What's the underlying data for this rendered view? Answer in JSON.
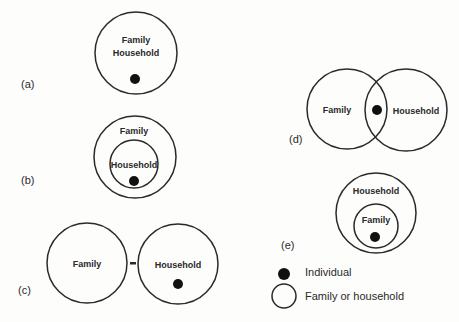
{
  "colors": {
    "stroke": "#2a2a2a",
    "dot": "#111111",
    "background": "#fdfdfc"
  },
  "panels": {
    "a": {
      "label": "(a)",
      "circle_text_1": "Family",
      "circle_text_2": "Household"
    },
    "b": {
      "label": "(b)",
      "outer": "Family",
      "inner": "Household"
    },
    "c": {
      "label": "(c)",
      "left": "Family",
      "right": "Household",
      "separator": "-"
    },
    "d": {
      "label": "(d)",
      "left": "Family",
      "right": "Household"
    },
    "e": {
      "label": "(e)",
      "outer": "Household",
      "inner": "Family"
    }
  },
  "legend": {
    "individual": "Individual",
    "family_or_household": "Family or household"
  }
}
